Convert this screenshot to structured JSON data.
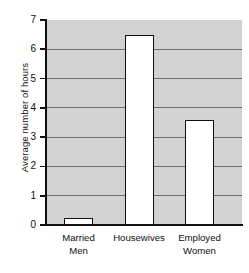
{
  "chart_data": {
    "type": "bar",
    "title": "",
    "xlabel": "",
    "ylabel": "Average number of hours",
    "categories": [
      "Married\nMen",
      "Housewives",
      "Employed\nWomen"
    ],
    "category_labels_flat": [
      "Married Men",
      "Housewives",
      "Employed Women"
    ],
    "values": [
      0.25,
      6.5,
      3.6
    ],
    "ylim": [
      0,
      7
    ],
    "ytick_labels": [
      "0",
      "1",
      "2",
      "3",
      "4",
      "5",
      "6",
      "7"
    ],
    "ytick_values": [
      0,
      1,
      2,
      3,
      4,
      5,
      6,
      7
    ],
    "grid": true,
    "grid_axis": "y",
    "legend": false,
    "colors": {
      "plot_background": "#d2d2d2",
      "bar_fill": "#ffffff",
      "bar_edge": "#101010",
      "gridline": "#6e6e6e",
      "axis": "#111111",
      "text": "#101010",
      "page_background": "#ffffff"
    }
  },
  "axis": {
    "y_title": "Average number of hours",
    "ticks": [
      {
        "label": "7",
        "value": 7
      },
      {
        "label": "6",
        "value": 6
      },
      {
        "label": "5",
        "value": 5
      },
      {
        "label": "4",
        "value": 4
      },
      {
        "label": "3",
        "value": 3
      },
      {
        "label": "2",
        "value": 2
      },
      {
        "label": "1",
        "value": 1
      },
      {
        "label": "0",
        "value": 0
      }
    ]
  },
  "bars": [
    {
      "label": "Married\nMen",
      "value": 0.25
    },
    {
      "label": "Housewives",
      "value": 6.5
    },
    {
      "label": "Employed\nWomen",
      "value": 3.6
    }
  ]
}
